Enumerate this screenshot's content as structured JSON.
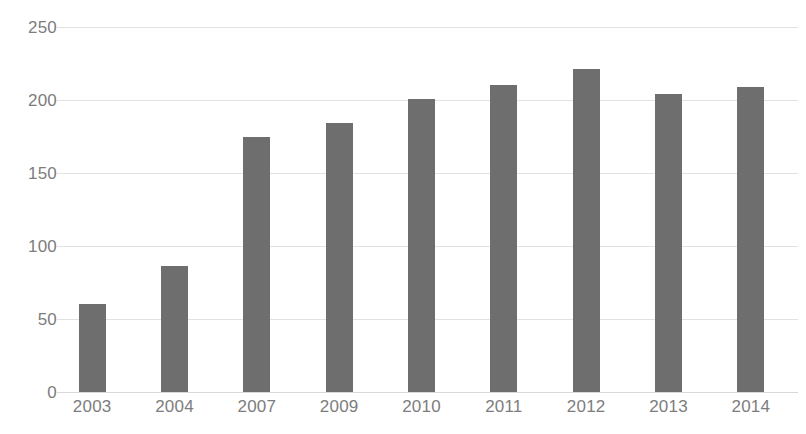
{
  "chart_data": {
    "type": "bar",
    "title": "",
    "subtitle": "",
    "xlabel": "",
    "ylabel": "",
    "categories": [
      "2003",
      "2004",
      "2007",
      "2009",
      "2010",
      "2011",
      "2012",
      "2013",
      "2014"
    ],
    "values": [
      60,
      86,
      175,
      184,
      201,
      210,
      221,
      204,
      209
    ],
    "ylim": [
      0,
      250
    ],
    "yticks": [
      0,
      50,
      100,
      150,
      200,
      250
    ],
    "ytick_labels": [
      "0",
      "50",
      "100",
      "150",
      "200",
      "250"
    ],
    "grid": true,
    "grid_axis": "y",
    "legend": false,
    "legend_position": "none",
    "bar_color": "#6e6e6e",
    "grid_color": "#e2e2e2",
    "tick_label_color": "#7d7d7d",
    "background_color": "#ffffff"
  }
}
